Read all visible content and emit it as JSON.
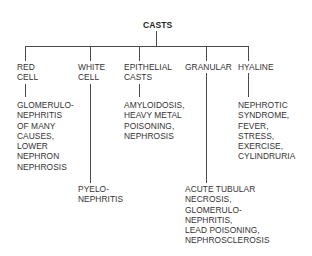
{
  "diagram": {
    "title": "CASTS",
    "categories": [
      {
        "id": "red-cell",
        "label": "RED\nCELL",
        "conditions": "GLOMERULO-\nNEPHRITIS\nOF MANY\nCAUSES,\nLOWER\nNEPHRON\nNEPHROSIS"
      },
      {
        "id": "white-cell",
        "label": "WHITE\nCELL",
        "conditions": "PYELO-\nNEPHRITIS"
      },
      {
        "id": "epithelial-casts",
        "label": "EPITHELIAL\nCASTS",
        "conditions": "AMYLOIDOSIS,\nHEAVY METAL\nPOISONING,\nNEPHROSIS"
      },
      {
        "id": "granular",
        "label": "GRANULAR",
        "conditions": "ACUTE TUBULAR\nNECROSIS,\nGLOMERULO-\nNEPHRITIS,\nLEAD POISONING,\nNEPHROSCLEROSIS"
      },
      {
        "id": "hyaline",
        "label": "HYALINE",
        "conditions": "NEPHROTIC\nSYNDROME,\nFEVER,\nSTRESS,\nEXERCISE,\nCYLINDRURIA"
      }
    ],
    "colors": {
      "line": "#4a4a4a",
      "text": "#333333",
      "background": "#ffffff"
    }
  }
}
